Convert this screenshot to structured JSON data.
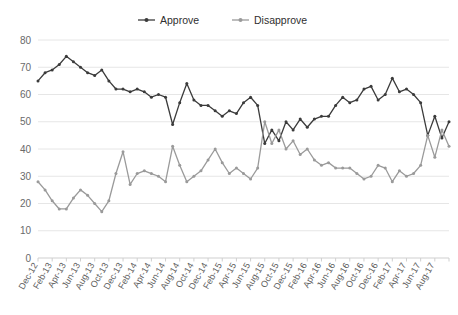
{
  "chart_data": {
    "type": "line",
    "title": "",
    "xlabel": "",
    "ylabel": "",
    "ylim": [
      0,
      80
    ],
    "ytick_step": 10,
    "yticks": [
      0,
      10,
      20,
      30,
      40,
      50,
      60,
      70,
      80
    ],
    "grid": true,
    "legend_position": "top-center",
    "markers": true,
    "colors": {
      "approve": "#3b3b3b",
      "disapprove": "#9a9a9a",
      "grid": "#e6e6e6",
      "axis": "#cfcfcf"
    },
    "x": [
      "Dec-12",
      "Jan-13",
      "Feb-13",
      "Mar-13",
      "Apr-13",
      "May-13",
      "Jun-13",
      "Jul-13",
      "Aug-13",
      "Sep-13",
      "Oct-13",
      "Nov-13",
      "Dec-13",
      "Jan-14",
      "Feb-14",
      "Mar-14",
      "Apr-14",
      "May-14",
      "Jun-14",
      "Jul-14",
      "Aug-14",
      "Sep-14",
      "Oct-14",
      "Nov-14",
      "Dec-14",
      "Jan-15",
      "Feb-15",
      "Mar-15",
      "Apr-15",
      "May-15",
      "Jun-15",
      "Jul-15",
      "Aug-15",
      "Sep-15",
      "Oct-15",
      "Nov-15",
      "Dec-15",
      "Jan-16",
      "Feb-16",
      "Mar-16",
      "Apr-16",
      "May-16",
      "Jun-16",
      "Jul-16",
      "Aug-16",
      "Sep-16",
      "Oct-16",
      "Nov-16",
      "Dec-16",
      "Jan-17",
      "Feb-17",
      "Mar-17",
      "Apr-17",
      "May-17",
      "Jun-17",
      "Jul-17",
      "Aug-17",
      "Sep-17",
      "Oct-17"
    ],
    "xtick_labels": [
      "Dec-12",
      "Feb-13",
      "Apr-13",
      "Jun-13",
      "Aug-13",
      "Oct-13",
      "Dec-13",
      "Feb-14",
      "Apr-14",
      "Jun-14",
      "Aug-14",
      "Oct-14",
      "Dec-14",
      "Feb-15",
      "Apr-15",
      "Jun-15",
      "Aug-15",
      "Oct-15",
      "Dec-15",
      "Feb-16",
      "Apr-16",
      "Jun-16",
      "Aug-16",
      "Oct-16",
      "Dec-16",
      "Feb-17",
      "Apr-17",
      "Jun-17",
      "Aug-17"
    ],
    "xtick_every": 2,
    "series": [
      {
        "name": "Approve",
        "key": "approve",
        "color": "#3b3b3b",
        "values": [
          65,
          68,
          69,
          71,
          74,
          72,
          70,
          68,
          67,
          69,
          65,
          62,
          62,
          61,
          62,
          61,
          59,
          60,
          59,
          49,
          57,
          64,
          58,
          56,
          56,
          54,
          52,
          54,
          53,
          57,
          59,
          56,
          42,
          47,
          43,
          50,
          47,
          51,
          48,
          51,
          52,
          52,
          56,
          59,
          57,
          58,
          62,
          63,
          58,
          60,
          66,
          61,
          62,
          60,
          57,
          45,
          52,
          44,
          50
        ]
      },
      {
        "name": "Disapprove",
        "key": "disapprove",
        "color": "#9a9a9a",
        "values": [
          28,
          25,
          21,
          18,
          18,
          22,
          25,
          23,
          20,
          17,
          21,
          31,
          39,
          27,
          31,
          32,
          31,
          30,
          28,
          41,
          34,
          28,
          30,
          32,
          36,
          40,
          35,
          31,
          33,
          31,
          29,
          33,
          50,
          42,
          47,
          40,
          43,
          38,
          40,
          36,
          34,
          35,
          33,
          33,
          33,
          31,
          29,
          30,
          34,
          33,
          28,
          32,
          30,
          31,
          34,
          45,
          37,
          47,
          41
        ]
      }
    ]
  },
  "legend": {
    "items": [
      {
        "label": "Approve",
        "color": "#3b3b3b"
      },
      {
        "label": "Disapprove",
        "color": "#9a9a9a"
      }
    ]
  },
  "caption": {
    "text": ""
  }
}
